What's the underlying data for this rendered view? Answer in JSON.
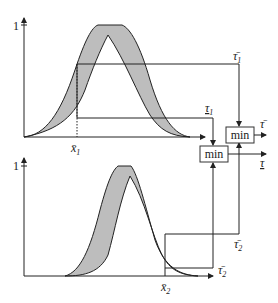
{
  "diagram": {
    "top_plot": {
      "y_tick_label": "1",
      "x_label": "x̄",
      "x_label_sub": "1",
      "upper_output_label": "τ̄",
      "upper_output_sub": "1",
      "lower_output_label": "τ",
      "lower_output_sub": "1"
    },
    "bottom_plot": {
      "y_tick_label": "1",
      "x_label": "x̄",
      "x_label_sub": "2",
      "upper_output_label": "τ̄",
      "upper_output_sub": "2",
      "lower_output_label": "τ̄",
      "lower_output_sub": "2"
    },
    "min_box_upper": {
      "label": "min",
      "output_label": "τ̄"
    },
    "min_box_lower": {
      "label": "min",
      "output_label": "τ"
    },
    "colors": {
      "band_fill": "#bdbdbd",
      "line": "#222222",
      "background": "#ffffff"
    }
  }
}
